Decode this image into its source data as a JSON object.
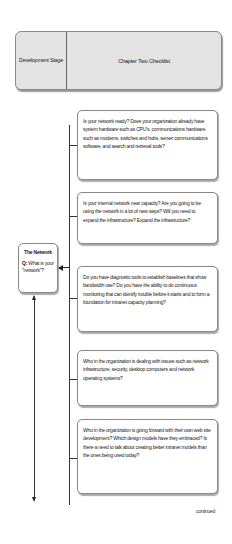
{
  "header": {
    "stage_label": "Development Stage",
    "title": "Chapter Two Checklist"
  },
  "stage": {
    "title": "The Network",
    "question_prefix": "Q:",
    "question": "What is your \"network\"?"
  },
  "checklist": [
    {
      "text": "Is your network ready? Does your organization already have system hardware such as CPU's, communications hardware such as modems, switches and hubs, server communications software, and search and retrieval tools?"
    },
    {
      "text": "Is your internal network near capacity? Are you going to be using the network in a lot of new ways? Will you need to expand the infrastructure? Expand the infrastructure?"
    },
    {
      "text": "Do you have diagnostic tools to establish baselines that show bandwidth use? Do you have the ability to do continuous monitoring that can identify trouble before it starts and to form a foundation for intranet capacity planning?"
    },
    {
      "text": "Who in the organization is dealing with issues such as network infrastructure, security, desktop computers and network operating systems?"
    },
    {
      "text": "Who in the organization is going forward with their own web site development? Which design models have they embraced? Is there a need to talk about creating better intranet models than the ones being used today?"
    }
  ],
  "footer": {
    "continued": "continued"
  }
}
